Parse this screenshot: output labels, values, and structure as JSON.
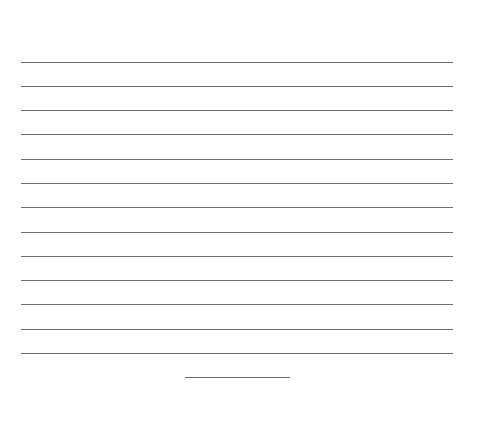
{
  "document": {
    "type": "blank-lined-page",
    "line_color": "#6f6f6f",
    "background": "#ffffff",
    "ruled_lines": {
      "count": 13,
      "x_start": 21,
      "x_end": 453,
      "y_positions": [
        62,
        86,
        110,
        134,
        159,
        183,
        207,
        232,
        256,
        280,
        304,
        329,
        353
      ]
    },
    "short_line": {
      "x_start": 185,
      "x_end": 290,
      "y": 377
    }
  }
}
